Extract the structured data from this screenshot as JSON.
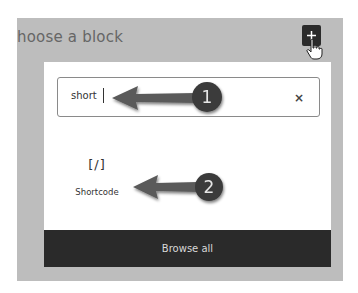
{
  "panel": {
    "title": "hoose a block"
  },
  "toolbar": {
    "add_block_icon": "plus-icon",
    "cursor_icon": "hand-pointer-icon"
  },
  "search": {
    "value": "short",
    "clear_icon": "×"
  },
  "results": [
    {
      "icon": "[/]",
      "label": "Shortcode"
    }
  ],
  "footer": {
    "browse_all_label": "Browse all"
  },
  "annotations": [
    {
      "number": "1",
      "color": "#3a3a3a"
    },
    {
      "number": "2",
      "color": "#3a3a3a"
    }
  ]
}
